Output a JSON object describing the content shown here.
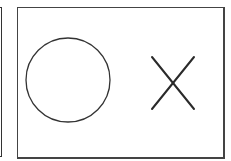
{
  "panels": [
    {
      "id": "left-panel",
      "partial": true
    },
    {
      "id": "main-panel",
      "shapes": [
        {
          "type": "circle",
          "label": "circle-shape",
          "cx": 68,
          "cy": 80,
          "r": 42
        },
        {
          "type": "cross",
          "label": "x-shape",
          "x1": 151,
          "y1": 57,
          "x2": 194,
          "y2": 109
        }
      ]
    }
  ],
  "colors": {
    "stroke": "#333333",
    "background": "#ffffff"
  }
}
